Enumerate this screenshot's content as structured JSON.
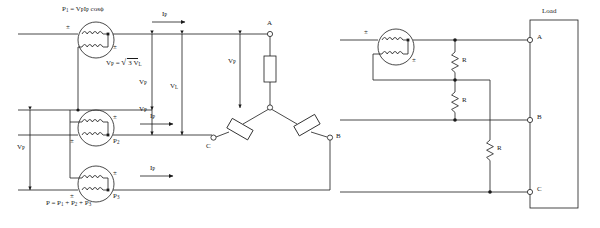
{
  "figure": {
    "background": "#ffffff",
    "line_color": "#1a1a1a",
    "text_color": "#1a1a1a"
  },
  "left_circuit": {
    "name": "three-wattmeter-method-wye-load",
    "formulas": {
      "power_per_phase": "P₁ = VₚIₚ cos ϕ",
      "voltage_relation": "Vₚ = √3 Vₗ",
      "total_power": "P = P₁ + P₂ + P₃"
    },
    "formula_parts": {
      "p1_lead": "P",
      "p1_sub": "1",
      "p1_eq": "= V",
      "p1_vsub": "P",
      "p1_i": "I",
      "p1_isub": "P",
      "p1_cos": "cos",
      "p1_phi": "ϕ",
      "vp_lead": "V",
      "vp_sub": "P",
      "vp_eq": "=",
      "vp_root": "3 V",
      "vp_rootsub": "L",
      "tot_lead": "P = P",
      "tot_s1": "1",
      "tot_plus1": "+ P",
      "tot_s2": "2",
      "tot_plus2": "+ P",
      "tot_s3": "3"
    },
    "wattmeters": [
      {
        "id": "wattmeter-1",
        "label": "P",
        "sub": "1",
        "polarity_left": "±",
        "polarity_right": "±"
      },
      {
        "id": "wattmeter-2",
        "label": "P",
        "sub": "2",
        "polarity_left": "±",
        "polarity_right": "±"
      },
      {
        "id": "wattmeter-3",
        "label": "P",
        "sub": "3",
        "polarity_left": "±",
        "polarity_right": "±"
      }
    ],
    "current_labels": [
      {
        "base": "I",
        "sub": "P"
      },
      {
        "base": "I",
        "sub": "P"
      },
      {
        "base": "I",
        "sub": "P"
      }
    ],
    "voltage_labels": [
      {
        "base": "V",
        "sub": "P",
        "position": "left-outer"
      },
      {
        "base": "V",
        "sub": "P",
        "position": "inner-lower"
      },
      {
        "base": "V",
        "sub": "L",
        "position": "center"
      },
      {
        "base": "V",
        "sub": "P",
        "position": "load-phase"
      }
    ],
    "load_terminals": [
      "A",
      "B",
      "C"
    ],
    "load_type": "wye",
    "load_elements": 3
  },
  "right_circuit": {
    "name": "single-wattmeter-artificial-neutral-load",
    "wattmeter": {
      "id": "wattmeter-right",
      "polarity_left": "±",
      "polarity_right": "±"
    },
    "resistors": [
      {
        "id": "resistor-r1",
        "label": "R"
      },
      {
        "id": "resistor-r2",
        "label": "R"
      },
      {
        "id": "resistor-r3",
        "label": "R"
      }
    ],
    "load_box": {
      "title": "Load",
      "terminals": [
        "A",
        "B",
        "C"
      ]
    }
  }
}
